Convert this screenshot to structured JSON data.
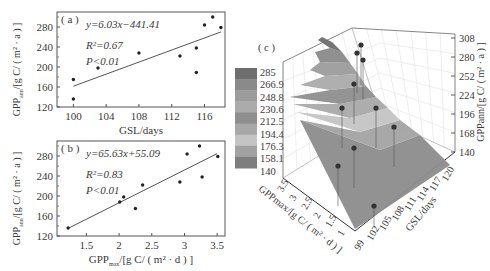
{
  "chart_data": [
    {
      "panel": "a",
      "type": "scatter",
      "panel_label": "( a )",
      "xlabel": "GSL/days",
      "ylabel": "GPP_ann /[g C/ ( m² · a ) ]",
      "ylabel_main": "GPP",
      "ylabel_sub": "ann",
      "ylabel_rest": "/[g C/ ( m² · a ) ]",
      "xlim": [
        98,
        118.5
      ],
      "ylim": [
        120,
        310
      ],
      "xticks": [
        100,
        104,
        108,
        112,
        116
      ],
      "yticks": [
        120,
        160,
        200,
        240,
        280
      ],
      "points": [
        {
          "x": 100,
          "y": 136
        },
        {
          "x": 100,
          "y": 175
        },
        {
          "x": 103,
          "y": 198
        },
        {
          "x": 108,
          "y": 228
        },
        {
          "x": 113,
          "y": 222
        },
        {
          "x": 115,
          "y": 189
        },
        {
          "x": 115,
          "y": 238
        },
        {
          "x": 116,
          "y": 284
        },
        {
          "x": 117,
          "y": 300
        },
        {
          "x": 118,
          "y": 279
        }
      ],
      "fit_line": {
        "x0": 100,
        "y0": 161.6,
        "x1": 118,
        "y1": 270.1
      },
      "equation": "y=6.03x−441.41",
      "r2": "R²=0.67",
      "p": "P<0.01",
      "grid": false
    },
    {
      "panel": "b",
      "type": "scatter",
      "panel_label": "( b )",
      "xlabel": "GPP_max /[g C/ ( m² · d ) ]",
      "xlabel_main": "GPP",
      "xlabel_sub": "max",
      "xlabel_rest": "/[g C/ ( m² · d ) ]",
      "ylabel": "GPP_ann /[g C/ ( m² · a ) ]",
      "ylabel_main": "GPP",
      "ylabel_sub": "ann",
      "ylabel_rest": "/[g C/ ( m² · a ) ]",
      "xlim": [
        1.05,
        3.62
      ],
      "ylim": [
        120,
        310
      ],
      "xticks": [
        1.5,
        2,
        2.5,
        3,
        3.5
      ],
      "yticks": [
        120,
        160,
        200,
        240,
        280
      ],
      "points": [
        {
          "x": 1.22,
          "y": 136
        },
        {
          "x": 2.01,
          "y": 188
        },
        {
          "x": 2.07,
          "y": 198
        },
        {
          "x": 2.25,
          "y": 175
        },
        {
          "x": 2.36,
          "y": 222
        },
        {
          "x": 2.93,
          "y": 228
        },
        {
          "x": 3.04,
          "y": 284
        },
        {
          "x": 3.23,
          "y": 300
        },
        {
          "x": 3.27,
          "y": 238
        },
        {
          "x": 3.51,
          "y": 279
        }
      ],
      "fit_line": {
        "x0": 1.22,
        "y0": 135.2,
        "x1": 3.5,
        "y1": 284.8
      },
      "equation": "y=65.63x+55.09",
      "r2": "R²=0.83",
      "p": "P<0.01",
      "grid": false
    },
    {
      "panel": "c",
      "type": "surface3d",
      "panel_label": "( c )",
      "xlabel": "GPP_max /[g C/ ( m² · d ) ]",
      "ylabel": "GSL/days",
      "zlabel": "GPP_ann /[g C/ ( m² · a ) ]",
      "x_ticks": [
        "3.5",
        "3",
        "2.5",
        "2",
        "1.5",
        "1"
      ],
      "y_ticks": [
        "99",
        "102",
        "105",
        "108",
        "111",
        "114",
        "117",
        "120"
      ],
      "z_ticks": [
        "140",
        "168",
        "196",
        "224",
        "252",
        "280",
        "308"
      ],
      "colorbar": {
        "levels": [
          "285",
          "266.9",
          "248.8",
          "230.6",
          "212.5",
          "194.4",
          "176.3",
          "158.1",
          "140"
        ],
        "colors": [
          "#6e6e6e",
          "#8a8a8a",
          "#9c9c9c",
          "#ababab",
          "#8e8e8e",
          "#a8a8a8",
          "#c4c4c4",
          "#a2a2a2",
          "#7e7e7e"
        ]
      }
    }
  ],
  "figure": {
    "panel_a_label": "( a )",
    "panel_b_label": "( b )",
    "panel_c_label": "( c )"
  }
}
